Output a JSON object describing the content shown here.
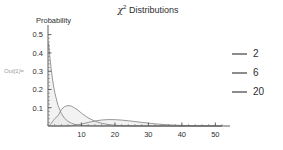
{
  "out_prompt": "Out[1]=",
  "title": {
    "symbol": "χ",
    "superscript": "2",
    "rest": " Distributions"
  },
  "legend": {
    "position": "right",
    "entries": [
      {
        "label": "2",
        "color": "#8c8c8c"
      },
      {
        "label": "6",
        "color": "#8c8c8c"
      },
      {
        "label": "20",
        "color": "#8c8c8c"
      }
    ]
  },
  "chart_data": {
    "type": "line",
    "subtitle": "",
    "xlabel": "",
    "ylabel": "Probability",
    "xlim": [
      0,
      52
    ],
    "ylim": [
      0,
      0.52
    ],
    "grid": false,
    "filled": true,
    "fill_color": "#e8e8e8",
    "line_color": "#8c8c8c",
    "xticks": [
      10,
      20,
      30,
      40,
      50
    ],
    "xticks_labels": [
      "10",
      "20",
      "30",
      "40",
      "50"
    ],
    "yticks": [
      0.1,
      0.2,
      0.3,
      0.4,
      0.5
    ],
    "yticks_labels": [
      "0.1",
      "0.2",
      "0.3",
      "0.4",
      "0.5"
    ],
    "minor_ticks": true,
    "legend_title": "",
    "x": [
      0.2,
      0.5,
      1,
      1.5,
      2,
      3,
      4,
      5,
      6,
      7,
      8,
      9,
      10,
      12,
      14,
      16,
      18,
      20,
      22,
      24,
      26,
      28,
      30,
      32,
      34,
      36,
      38,
      40,
      44,
      48,
      52
    ],
    "series": [
      {
        "name": "2",
        "df": 2,
        "color": "#8c8c8c",
        "values": [
          0.452,
          0.389,
          0.303,
          0.236,
          0.184,
          0.112,
          0.068,
          0.041,
          0.025,
          0.015,
          0.009,
          0.006,
          0.003,
          0.001,
          0.0005,
          0.0002,
          0.0001,
          5e-05,
          2e-05,
          1e-05,
          4e-06,
          1e-06,
          6e-07,
          2e-07,
          1e-07,
          4e-08,
          2e-08,
          5e-09,
          5e-10,
          5e-11,
          5e-12
        ]
      },
      {
        "name": "6",
        "df": 6,
        "color": "#8c8c8c",
        "values": [
          0.0009,
          0.0049,
          0.0153,
          0.028,
          0.0398,
          0.0563,
          0.0902,
          0.1068,
          0.112,
          0.1087,
          0.098,
          0.0863,
          0.0702,
          0.0446,
          0.0264,
          0.0149,
          0.0081,
          0.0043,
          0.0022,
          0.0011,
          0.0006,
          0.0003,
          0.0001,
          7e-05,
          3e-05,
          2e-05,
          8e-06,
          4e-06,
          1e-06,
          2e-07,
          5e-08
        ]
      },
      {
        "name": "20",
        "df": 20,
        "color": "#8c8c8c",
        "values": [
          0.0,
          0.0,
          0.0,
          0.0,
          0.0,
          0.0,
          0.0,
          0.0001,
          0.0005,
          0.0016,
          0.0037,
          0.0069,
          0.0108,
          0.0194,
          0.0273,
          0.0327,
          0.0351,
          0.0347,
          0.0323,
          0.0286,
          0.0243,
          0.0199,
          0.0157,
          0.012,
          0.0089,
          0.0065,
          0.0046,
          0.0032,
          0.0015,
          0.0007,
          0.0003
        ]
      }
    ],
    "annotations": []
  }
}
